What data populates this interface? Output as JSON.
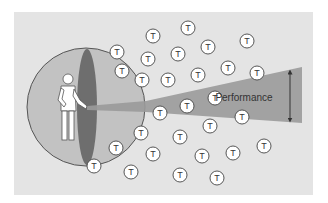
{
  "diagram": {
    "colors": {
      "panel": "#e4e4e4",
      "sphere_fill": "#c2c2c2",
      "sphere_stroke": "#555555",
      "sphere_slice": "#6e6e6e",
      "beam": "#9a9a9a",
      "node_fill": "#ffffff",
      "node_stroke": "#444444",
      "text": "#333333"
    },
    "panel": {
      "x": 14,
      "y": 12,
      "w": 299,
      "h": 183
    },
    "sphere": {
      "cx": 86,
      "cy": 107,
      "r": 59
    },
    "slice": {
      "cx": 87,
      "cy": 107,
      "rx": 10,
      "ry": 58
    },
    "person": {
      "head": {
        "cx": 68,
        "cy": 79,
        "r": 5
      }
    },
    "beam": {
      "points": "87,106 146,101 302,67 302,123 146,112 87,110"
    },
    "performance": {
      "label": "Performance",
      "label_x": 244,
      "label_y": 101,
      "arrow": {
        "x": 290,
        "y1": 72,
        "y2": 120
      }
    },
    "node_label": "T",
    "node_radius": 7,
    "nodes": [
      {
        "x": 117,
        "y": 52
      },
      {
        "x": 153,
        "y": 36
      },
      {
        "x": 188,
        "y": 28
      },
      {
        "x": 247,
        "y": 41
      },
      {
        "x": 208,
        "y": 47
      },
      {
        "x": 148,
        "y": 59
      },
      {
        "x": 178,
        "y": 54
      },
      {
        "x": 122,
        "y": 71
      },
      {
        "x": 228,
        "y": 68
      },
      {
        "x": 257,
        "y": 73
      },
      {
        "x": 198,
        "y": 75
      },
      {
        "x": 168,
        "y": 80
      },
      {
        "x": 142,
        "y": 80
      },
      {
        "x": 215,
        "y": 98
      },
      {
        "x": 187,
        "y": 106
      },
      {
        "x": 160,
        "y": 113
      },
      {
        "x": 242,
        "y": 117
      },
      {
        "x": 210,
        "y": 126
      },
      {
        "x": 141,
        "y": 133
      },
      {
        "x": 180,
        "y": 137
      },
      {
        "x": 116,
        "y": 148
      },
      {
        "x": 153,
        "y": 154
      },
      {
        "x": 202,
        "y": 156
      },
      {
        "x": 233,
        "y": 153
      },
      {
        "x": 264,
        "y": 146
      },
      {
        "x": 131,
        "y": 172
      },
      {
        "x": 180,
        "y": 175
      },
      {
        "x": 217,
        "y": 178
      },
      {
        "x": 94,
        "y": 166
      }
    ]
  }
}
